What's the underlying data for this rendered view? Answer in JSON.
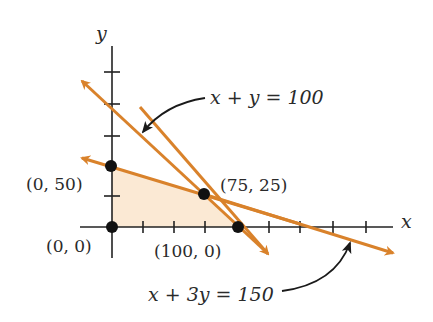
{
  "diagram": {
    "type": "linear-programming-feasible-region",
    "axes": {
      "x_label": "x",
      "y_label": "y",
      "tick_interval": 25
    },
    "colors": {
      "line": "#d9822b",
      "region": "#fbe9d4",
      "axis": "#222222",
      "point": "#111111"
    },
    "lines": [
      {
        "label": "x + y = 100",
        "equation": "x + y = 100"
      },
      {
        "label": "x + 3y = 150",
        "equation": "x + 3y = 150"
      }
    ],
    "points": [
      {
        "label": "(0, 50)",
        "x": 0,
        "y": 50
      },
      {
        "label": "(75, 25)",
        "x": 75,
        "y": 25
      },
      {
        "label": "(0, 0)",
        "x": 0,
        "y": 0
      },
      {
        "label": "(100, 0)",
        "x": 100,
        "y": 0
      }
    ]
  }
}
